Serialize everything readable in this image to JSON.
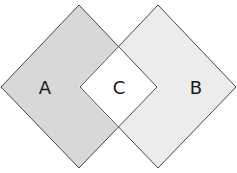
{
  "diagram": {
    "regions": [
      {
        "id": "A",
        "label": "A",
        "fill": "#d8d8d8"
      },
      {
        "id": "B",
        "label": "B",
        "fill": "#ececec"
      },
      {
        "id": "C",
        "label": "C",
        "fill": "#ffffff"
      }
    ],
    "stroke": "#333333"
  }
}
